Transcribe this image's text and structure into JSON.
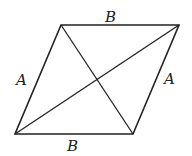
{
  "diagram": {
    "shape": "parallelogram",
    "vertices": {
      "top_left": [
        61,
        25
      ],
      "top_right": [
        179,
        25
      ],
      "bottom_right": [
        133,
        134
      ],
      "bottom_left": [
        15,
        134
      ]
    },
    "labels": {
      "top": "B",
      "bottom": "B",
      "left": "A",
      "right": "A"
    },
    "diagonals": [
      "top_left-bottom_right",
      "bottom_left-top_right"
    ],
    "stroke_color": "#222222"
  }
}
